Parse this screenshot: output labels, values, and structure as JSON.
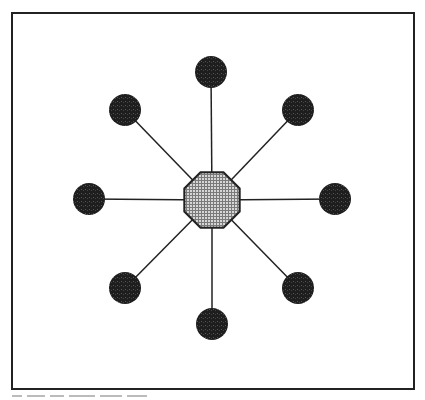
{
  "diagram": {
    "type": "star-topology",
    "hub": {
      "shape": "octagon",
      "cx": 212,
      "cy": 200,
      "radius": 30,
      "fill": "#b8b8b8",
      "pattern": "dotted-grid"
    },
    "nodes": [
      {
        "id": "top",
        "cx": 211,
        "cy": 72
      },
      {
        "id": "top-right",
        "cx": 298,
        "cy": 110
      },
      {
        "id": "right",
        "cx": 335,
        "cy": 199
      },
      {
        "id": "bottom-right",
        "cx": 298,
        "cy": 288
      },
      {
        "id": "bottom",
        "cx": 212,
        "cy": 324
      },
      {
        "id": "bottom-left",
        "cx": 125,
        "cy": 288
      },
      {
        "id": "left",
        "cx": 89,
        "cy": 199
      },
      {
        "id": "top-left",
        "cx": 125,
        "cy": 110
      }
    ],
    "node_radius": 16,
    "node_fill": "#2a2a2a",
    "line_color": "#222222"
  }
}
